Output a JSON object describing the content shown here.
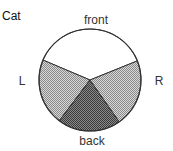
{
  "chart_data": {
    "type": "pie",
    "title": "Cat",
    "start_angle_deg": 22,
    "direction": "counterclockwise",
    "slices": [
      {
        "label": "front",
        "degrees": 135,
        "percent": 37.5,
        "fill": "white"
      },
      {
        "label": "L",
        "degrees": 76,
        "percent": 21.1,
        "fill": "light-stipple"
      },
      {
        "label": "back",
        "degrees": 72,
        "percent": 20.0,
        "fill": "dark-stipple"
      },
      {
        "label": "R",
        "degrees": 77,
        "percent": 21.4,
        "fill": "light-stipple"
      }
    ],
    "legend": "none"
  },
  "colors": {
    "outline": "#333333",
    "white": "#ffffff",
    "light-stipple": "#b8b8b8",
    "dark-stipple": "#6e6e6e"
  }
}
